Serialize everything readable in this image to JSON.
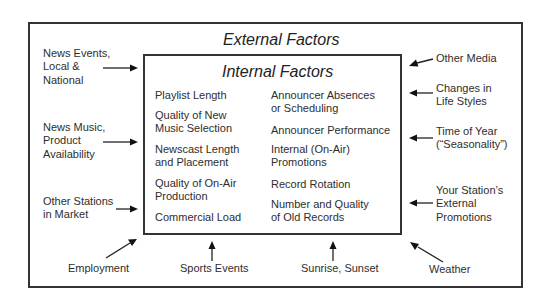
{
  "diagram": {
    "outer_title": "External Factors",
    "inner_title": "Internal Factors",
    "internal_factors": {
      "left_column": [
        "Playlist Length",
        "Quality of New\nMusic Selection",
        "Newscast Length\nand Placement",
        "Quality of On-Air\nProduction",
        "Commercial Load"
      ],
      "right_column": [
        "Announcer Absences\nor Scheduling",
        "Announcer Performance",
        "Internal (On-Air)\nPromotions",
        "Record Rotation",
        "Number and Quality\nof Old Records"
      ]
    },
    "external_factors": {
      "left": [
        "News Events,\nLocal &\nNational",
        "News Music,\nProduct\nAvailability",
        "Other Stations\nin Market"
      ],
      "right": [
        "Other Media",
        "Changes in\nLife Styles",
        "Time of Year\n(“Seasonality”)",
        "Your Station’s\nExternal\nPromotions"
      ],
      "bottom": [
        "Employment",
        "Sports Events",
        "Sunrise, Sunset",
        "Weather"
      ]
    }
  }
}
